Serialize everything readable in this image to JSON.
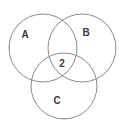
{
  "diagram": {
    "type": "venn",
    "sets": [
      {
        "label": "A",
        "cx": 43,
        "cy": 48,
        "r": 34
      },
      {
        "label": "B",
        "cx": 82,
        "cy": 48,
        "r": 34
      },
      {
        "label": "C",
        "cx": 65,
        "cy": 87,
        "r": 34
      }
    ],
    "labels": {
      "a": "A",
      "b": "B",
      "c": "C",
      "center": "2"
    },
    "stroke_color": "#8a8a8a"
  }
}
